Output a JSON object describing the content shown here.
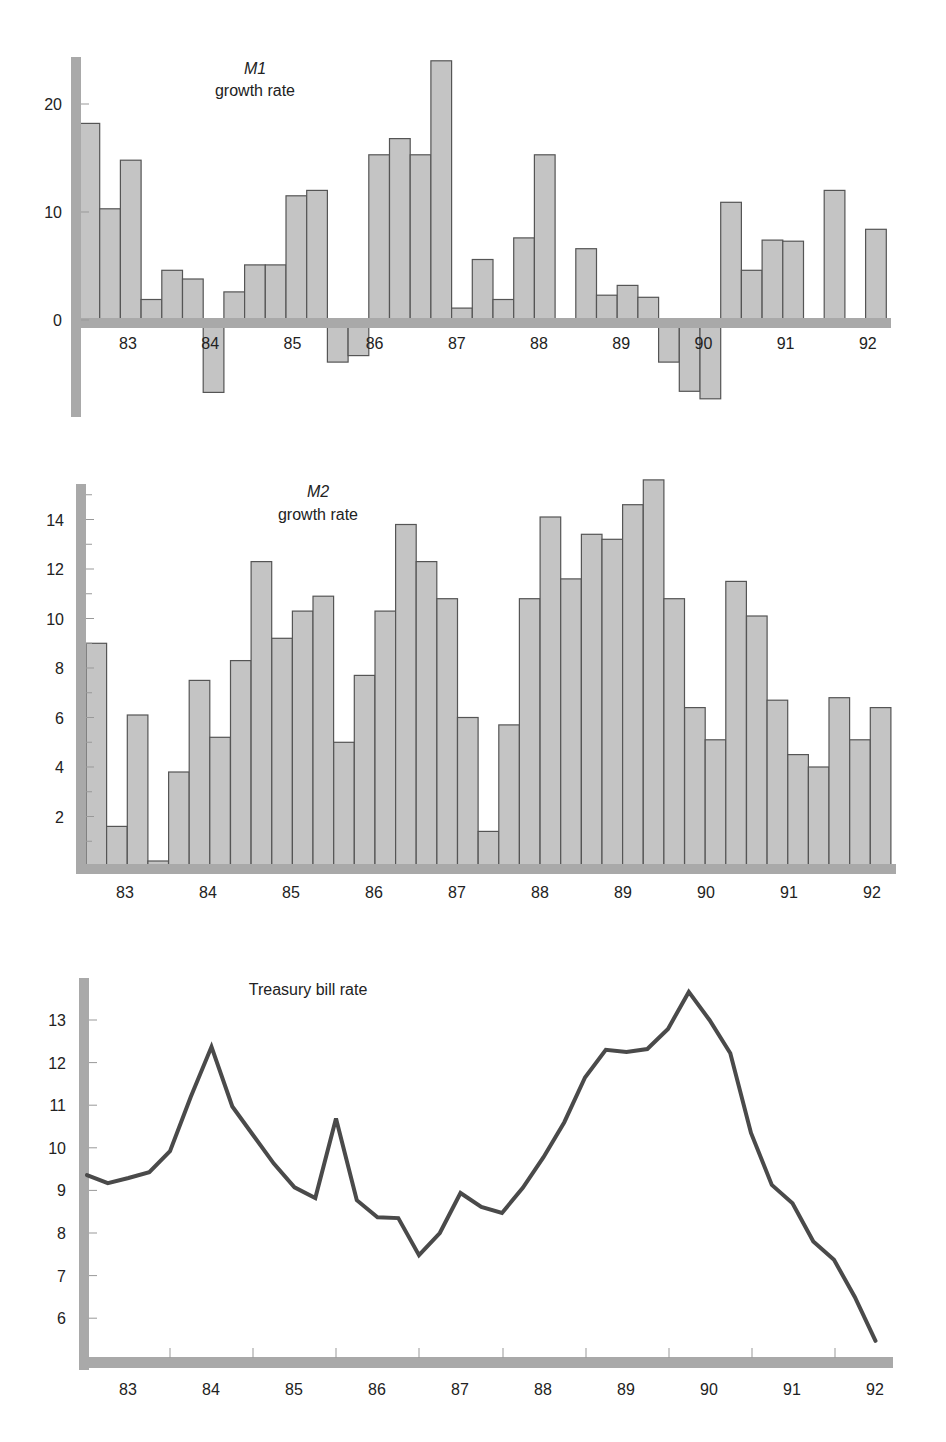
{
  "chart_data": [
    {
      "id": "m1",
      "type": "bar",
      "title_italic": "M1",
      "title": "growth rate",
      "xlabel": "",
      "ylabel": "",
      "ylim": [
        -8.5,
        25
      ],
      "yticks": [
        0,
        10,
        20
      ],
      "x_tick_labels": [
        "83",
        "84",
        "85",
        "86",
        "87",
        "88",
        "89",
        "90",
        "91",
        "92"
      ],
      "period": "quarterly, 1983–1992",
      "values": [
        18.2,
        10.3,
        14.8,
        1.9,
        4.6,
        3.8,
        -6.7,
        2.6,
        5.1,
        5.1,
        11.5,
        12.0,
        -3.9,
        -3.3,
        15.3,
        16.8,
        15.3,
        24.0,
        1.1,
        5.6,
        1.9,
        7.6,
        15.3,
        0,
        6.6,
        2.3,
        3.2,
        2.1,
        -3.9,
        -6.6,
        -7.3,
        10.9,
        4.6,
        7.4,
        7.3,
        0,
        12.0,
        0,
        8.4
      ],
      "grid": false
    },
    {
      "id": "m2",
      "type": "bar",
      "title_italic": "M2",
      "title": "growth rate",
      "xlabel": "",
      "ylabel": "",
      "ylim": [
        0,
        15.8
      ],
      "yticks": [
        2,
        4,
        6,
        8,
        10,
        12,
        14
      ],
      "x_tick_labels": [
        "83",
        "84",
        "85",
        "86",
        "87",
        "88",
        "89",
        "90",
        "91",
        "92"
      ],
      "period": "quarterly, 1983–1992",
      "values": [
        9.0,
        1.6,
        6.1,
        0.2,
        3.8,
        7.5,
        5.2,
        8.3,
        12.3,
        9.2,
        10.3,
        10.9,
        5.0,
        7.7,
        10.3,
        13.8,
        12.3,
        10.8,
        6.0,
        1.4,
        5.7,
        10.8,
        14.1,
        11.6,
        13.4,
        13.2,
        14.6,
        15.6,
        10.8,
        6.4,
        5.1,
        11.5,
        10.1,
        6.7,
        4.5,
        4.0,
        6.8,
        5.1,
        6.4
      ],
      "grid": false
    },
    {
      "id": "tbill",
      "type": "line",
      "title": "Treasury bill rate",
      "xlabel": "",
      "ylabel": "",
      "ylim": [
        5,
        13.9
      ],
      "yticks": [
        6,
        7,
        8,
        9,
        10,
        11,
        12,
        13
      ],
      "x_tick_labels": [
        "83",
        "84",
        "85",
        "86",
        "87",
        "88",
        "89",
        "90",
        "91",
        "92"
      ],
      "period": "quarterly, 1983–1992",
      "values": [
        9.36,
        9.17,
        9.29,
        9.43,
        9.92,
        11.2,
        12.37,
        10.97,
        10.3,
        9.63,
        9.07,
        8.82,
        10.69,
        8.77,
        8.37,
        8.35,
        7.48,
        8.0,
        8.94,
        8.61,
        8.47,
        9.06,
        9.78,
        10.6,
        11.65,
        12.3,
        12.25,
        12.32,
        12.79,
        13.66,
        13.0,
        12.22,
        10.35,
        9.13,
        8.7,
        7.8,
        7.37,
        6.5,
        5.47
      ],
      "grid": false
    }
  ]
}
